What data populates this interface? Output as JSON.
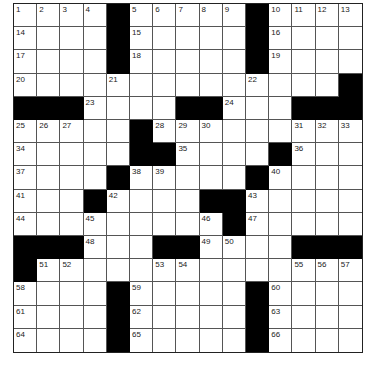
{
  "puzzle": {
    "rows": 15,
    "cols": 15,
    "black_cells": [
      [
        0,
        4
      ],
      [
        0,
        10
      ],
      [
        1,
        4
      ],
      [
        1,
        10
      ],
      [
        2,
        4
      ],
      [
        2,
        10
      ],
      [
        3,
        14
      ],
      [
        4,
        0
      ],
      [
        4,
        1
      ],
      [
        4,
        2
      ],
      [
        4,
        7
      ],
      [
        4,
        8
      ],
      [
        4,
        12
      ],
      [
        4,
        13
      ],
      [
        4,
        14
      ],
      [
        5,
        5
      ],
      [
        6,
        5
      ],
      [
        6,
        6
      ],
      [
        6,
        11
      ],
      [
        7,
        4
      ],
      [
        7,
        10
      ],
      [
        8,
        3
      ],
      [
        8,
        8
      ],
      [
        8,
        9
      ],
      [
        9,
        9
      ],
      [
        10,
        0
      ],
      [
        10,
        1
      ],
      [
        10,
        2
      ],
      [
        10,
        6
      ],
      [
        10,
        7
      ],
      [
        10,
        12
      ],
      [
        10,
        13
      ],
      [
        10,
        14
      ],
      [
        11,
        0
      ],
      [
        12,
        4
      ],
      [
        12,
        10
      ],
      [
        13,
        4
      ],
      [
        13,
        10
      ],
      [
        14,
        4
      ],
      [
        14,
        10
      ]
    ],
    "numbers": [
      {
        "r": 0,
        "c": 0,
        "n": "1"
      },
      {
        "r": 0,
        "c": 1,
        "n": "2"
      },
      {
        "r": 0,
        "c": 2,
        "n": "3"
      },
      {
        "r": 0,
        "c": 3,
        "n": "4"
      },
      {
        "r": 0,
        "c": 5,
        "n": "5"
      },
      {
        "r": 0,
        "c": 6,
        "n": "6"
      },
      {
        "r": 0,
        "c": 7,
        "n": "7"
      },
      {
        "r": 0,
        "c": 8,
        "n": "8"
      },
      {
        "r": 0,
        "c": 9,
        "n": "9"
      },
      {
        "r": 0,
        "c": 11,
        "n": "10"
      },
      {
        "r": 0,
        "c": 12,
        "n": "11"
      },
      {
        "r": 0,
        "c": 13,
        "n": "12"
      },
      {
        "r": 0,
        "c": 14,
        "n": "13"
      },
      {
        "r": 1,
        "c": 0,
        "n": "14"
      },
      {
        "r": 1,
        "c": 5,
        "n": "15"
      },
      {
        "r": 1,
        "c": 11,
        "n": "16"
      },
      {
        "r": 2,
        "c": 0,
        "n": "17"
      },
      {
        "r": 2,
        "c": 5,
        "n": "18"
      },
      {
        "r": 2,
        "c": 11,
        "n": "19"
      },
      {
        "r": 3,
        "c": 0,
        "n": "20"
      },
      {
        "r": 3,
        "c": 4,
        "n": "21"
      },
      {
        "r": 3,
        "c": 10,
        "n": "22"
      },
      {
        "r": 4,
        "c": 3,
        "n": "23"
      },
      {
        "r": 4,
        "c": 9,
        "n": "24"
      },
      {
        "r": 5,
        "c": 0,
        "n": "25"
      },
      {
        "r": 5,
        "c": 1,
        "n": "26"
      },
      {
        "r": 5,
        "c": 2,
        "n": "27"
      },
      {
        "r": 5,
        "c": 6,
        "n": "28"
      },
      {
        "r": 5,
        "c": 7,
        "n": "29"
      },
      {
        "r": 5,
        "c": 8,
        "n": "30"
      },
      {
        "r": 5,
        "c": 12,
        "n": "31"
      },
      {
        "r": 5,
        "c": 13,
        "n": "32"
      },
      {
        "r": 5,
        "c": 14,
        "n": "33"
      },
      {
        "r": 6,
        "c": 0,
        "n": "34"
      },
      {
        "r": 6,
        "c": 7,
        "n": "35"
      },
      {
        "r": 6,
        "c": 12,
        "n": "36"
      },
      {
        "r": 7,
        "c": 0,
        "n": "37"
      },
      {
        "r": 7,
        "c": 5,
        "n": "38"
      },
      {
        "r": 7,
        "c": 6,
        "n": "39"
      },
      {
        "r": 7,
        "c": 11,
        "n": "40"
      },
      {
        "r": 8,
        "c": 0,
        "n": "41"
      },
      {
        "r": 8,
        "c": 4,
        "n": "42"
      },
      {
        "r": 8,
        "c": 10,
        "n": "43"
      },
      {
        "r": 9,
        "c": 0,
        "n": "44"
      },
      {
        "r": 9,
        "c": 3,
        "n": "45"
      },
      {
        "r": 9,
        "c": 8,
        "n": "46"
      },
      {
        "r": 9,
        "c": 10,
        "n": "47"
      },
      {
        "r": 10,
        "c": 3,
        "n": "48"
      },
      {
        "r": 10,
        "c": 8,
        "n": "49"
      },
      {
        "r": 10,
        "c": 9,
        "n": "50"
      },
      {
        "r": 11,
        "c": 1,
        "n": "51"
      },
      {
        "r": 11,
        "c": 2,
        "n": "52"
      },
      {
        "r": 11,
        "c": 6,
        "n": "53"
      },
      {
        "r": 11,
        "c": 7,
        "n": "54"
      },
      {
        "r": 11,
        "c": 12,
        "n": "55"
      },
      {
        "r": 11,
        "c": 13,
        "n": "56"
      },
      {
        "r": 11,
        "c": 14,
        "n": "57"
      },
      {
        "r": 12,
        "c": 0,
        "n": "58"
      },
      {
        "r": 12,
        "c": 5,
        "n": "59"
      },
      {
        "r": 12,
        "c": 11,
        "n": "60"
      },
      {
        "r": 13,
        "c": 0,
        "n": "61"
      },
      {
        "r": 13,
        "c": 5,
        "n": "62"
      },
      {
        "r": 13,
        "c": 11,
        "n": "63"
      },
      {
        "r": 14,
        "c": 0,
        "n": "64"
      },
      {
        "r": 14,
        "c": 5,
        "n": "65"
      },
      {
        "r": 14,
        "c": 11,
        "n": "66"
      }
    ],
    "colors": {
      "black": "#000000",
      "white": "#ffffff",
      "line": "#555555",
      "number": "#222222"
    }
  }
}
